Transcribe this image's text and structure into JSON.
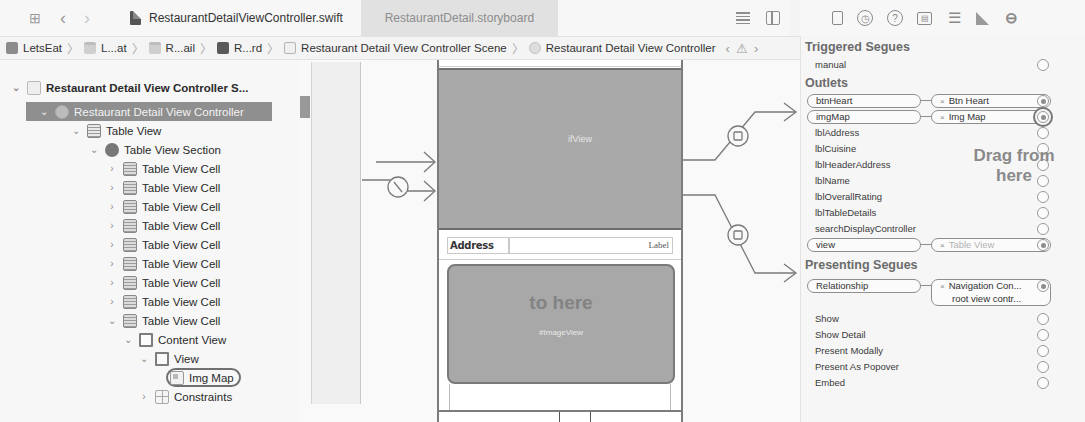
{
  "tabbar": {
    "icons": [
      "grid-icon",
      "back-icon",
      "forward-icon"
    ],
    "tabs": [
      {
        "label": "RestaurantDetailViewController.swift",
        "active": true
      },
      {
        "label": "RestaurantDetail.storyboard",
        "active": false
      }
    ],
    "editor_icons": [
      "editor-options-icon",
      "add-editor-icon"
    ]
  },
  "inspector_tabs": [
    "file-inspector-icon",
    "history-icon",
    "help-icon",
    "identity-inspector-icon",
    "attributes-inspector-icon",
    "size-inspector-icon",
    "connections-inspector-icon"
  ],
  "breadcrumb": {
    "items": [
      {
        "label": "LetsEat",
        "icon": "project-icon"
      },
      {
        "label": "L...at",
        "icon": "folder-icon"
      },
      {
        "label": "R...ail",
        "icon": "folder-icon"
      },
      {
        "label": "R...rd",
        "icon": "storyboard-icon"
      },
      {
        "label": "Restaurant Detail View Controller Scene",
        "icon": "scene-icon"
      },
      {
        "label": "Restaurant Detail View Controller",
        "icon": "view-controller-icon"
      }
    ],
    "sep": "〉",
    "nav": {
      "prev": "‹",
      "warn": "⚠",
      "next": "›"
    }
  },
  "outline": {
    "items": [
      {
        "label": "Restaurant Detail View Controller S...",
        "chev": "⌄",
        "icon": "scene"
      },
      {
        "label": "Restaurant Detail View Controller",
        "chev": "⌄",
        "icon": "vc",
        "selected": true
      },
      {
        "label": "Table View",
        "chev": "⌄",
        "icon": "table"
      },
      {
        "label": "Table View Section",
        "chev": "⌄",
        "icon": "section"
      },
      {
        "label": "Table View Cell",
        "chev": "›",
        "icon": "cell"
      },
      {
        "label": "Table View Cell",
        "chev": "›",
        "icon": "cell"
      },
      {
        "label": "Table View Cell",
        "chev": "›",
        "icon": "cell"
      },
      {
        "label": "Table View Cell",
        "chev": "›",
        "icon": "cell"
      },
      {
        "label": "Table View Cell",
        "chev": "›",
        "icon": "cell"
      },
      {
        "label": "Table View Cell",
        "chev": "›",
        "icon": "cell"
      },
      {
        "label": "Table View Cell",
        "chev": "›",
        "icon": "cell"
      },
      {
        "label": "Table View Cell",
        "chev": "›",
        "icon": "cell"
      },
      {
        "label": "Table View Cell",
        "chev": "⌄",
        "icon": "cell"
      },
      {
        "label": "Content View",
        "chev": "⌄",
        "icon": "view"
      },
      {
        "label": "View",
        "chev": "⌄",
        "icon": "view"
      },
      {
        "label": "Img Map",
        "chev": "",
        "icon": "image",
        "highlighted": true
      },
      {
        "label": "Constraints",
        "chev": "›",
        "icon": "constraints"
      }
    ]
  },
  "canvas": {
    "header_view_label": "ifView",
    "address_label": "Address",
    "address_value": "Label",
    "drop_hint": "to here",
    "map_image_label": "#ImageView"
  },
  "inspector": {
    "triggered_segues": {
      "title": "Triggered Segues",
      "items": [
        {
          "name": "manual"
        }
      ]
    },
    "outlets": {
      "title": "Outlets",
      "items": [
        {
          "name": "btnHeart",
          "target": "Btn Heart",
          "connected": true
        },
        {
          "name": "imgMap",
          "target": "Img Map",
          "connected": true,
          "highlighted": true
        },
        {
          "name": "lblAddress"
        },
        {
          "name": "lblCuisine"
        },
        {
          "name": "lblHeaderAddress"
        },
        {
          "name": "lblName"
        },
        {
          "name": "lblOverallRating"
        },
        {
          "name": "lblTableDetails"
        },
        {
          "name": "searchDisplayController"
        },
        {
          "name": "view",
          "target": "Table View",
          "connected": true,
          "faded": true
        }
      ]
    },
    "drag_hint": "Drag from here",
    "presenting_segues": {
      "title": "Presenting Segues",
      "relationship": {
        "name": "Relationship",
        "target_line1": "Navigation Con...",
        "target_line2": "root view contr..."
      },
      "items": [
        {
          "name": "Show"
        },
        {
          "name": "Show Detail"
        },
        {
          "name": "Present Modally"
        },
        {
          "name": "Present As Popover"
        },
        {
          "name": "Embed"
        }
      ]
    },
    "remove_glyph": "×"
  }
}
